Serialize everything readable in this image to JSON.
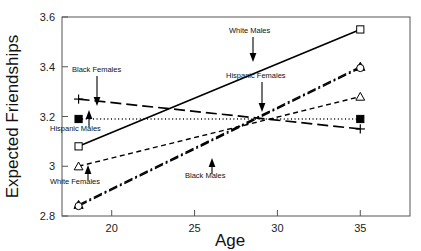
{
  "chart_data": {
    "type": "line",
    "title": "",
    "xlabel": "Age",
    "ylabel": "Expected Friendships",
    "xlim": [
      17,
      38
    ],
    "ylim": [
      2.8,
      3.6
    ],
    "xticks": [
      20,
      25,
      30,
      35
    ],
    "xtick_labels": [
      "20",
      "25",
      "30",
      "35"
    ],
    "yticks": [
      2.8,
      3.0,
      3.2,
      3.4,
      3.6
    ],
    "ytick_labels": [
      "2.8",
      "3",
      "3.2",
      "3.4",
      "3.6"
    ],
    "grid": false,
    "legend": "annotations-inline",
    "x": [
      18,
      35
    ],
    "series": [
      {
        "name": "White Males",
        "values": [
          3.08,
          3.55
        ],
        "marker": "open-square",
        "dash": "solid",
        "width": 1.6
      },
      {
        "name": "Hispanic Females",
        "values": [
          2.845,
          3.4
        ],
        "marker": "filled-triangle",
        "dash": "dash-dot",
        "width": 1.5
      },
      {
        "name": "White Females",
        "values": [
          3.0,
          3.28
        ],
        "marker": "open-triangle",
        "dash": "short-dash",
        "width": 1.4
      },
      {
        "name": "Hispanic Males",
        "values": [
          3.19,
          3.19
        ],
        "marker": "filled-square",
        "dash": "dotted",
        "width": 1.4
      },
      {
        "name": "Black Females",
        "values": [
          3.27,
          3.15
        ],
        "marker": "plus",
        "dash": "long-dash",
        "width": 1.7
      },
      {
        "name": "Black Males",
        "values": [
          2.84,
          3.395
        ],
        "marker": "open-circle",
        "dash": "dash-dot",
        "width": 1.5
      }
    ],
    "annotations": [
      {
        "text": "Black Females",
        "label_x": 72,
        "label_y": 72,
        "arrow_x": 97,
        "arrow_y_from": 76,
        "arrow_y_to": 106
      },
      {
        "text": "Hispanic Males",
        "label_x": 50,
        "label_y": 131,
        "arrow_x": 89,
        "arrow_y_from": 127,
        "arrow_y_to": 110
      },
      {
        "text": "White Females",
        "label_x": 50,
        "label_y": 184,
        "arrow_x": 88,
        "arrow_y_from": 180,
        "arrow_y_to": 165
      },
      {
        "text": "White Males",
        "label_x": 229,
        "label_y": 33,
        "arrow_x": 253,
        "arrow_y_from": 37,
        "arrow_y_to": 62
      },
      {
        "text": "Hispanic Females",
        "label_x": 226,
        "label_y": 78,
        "arrow_x": 262,
        "arrow_y_from": 82,
        "arrow_y_to": 112
      },
      {
        "text": "Black Males",
        "label_x": 185,
        "label_y": 178,
        "arrow_x": 212,
        "arrow_y_from": 174,
        "arrow_y_to": 158
      }
    ]
  }
}
